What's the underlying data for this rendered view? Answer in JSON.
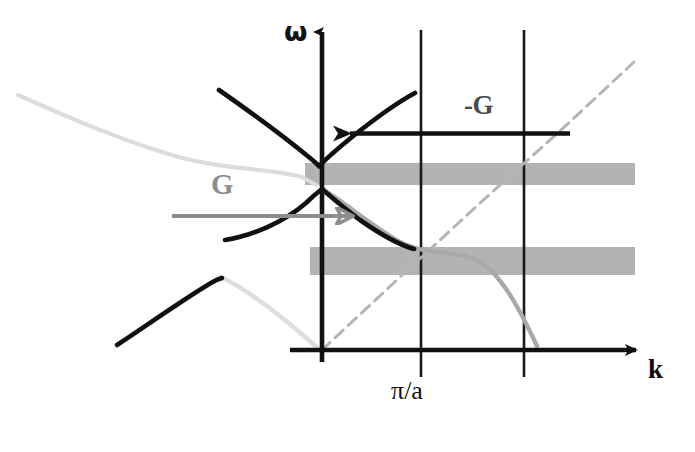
{
  "figure": {
    "background_color": "#ffffff"
  },
  "axes": {
    "y_axis": {
      "label": "ω",
      "name": "omega",
      "x_px": 322,
      "top_px": 25,
      "bottom_px": 360
    },
    "x_axis": {
      "label": "k",
      "name": "wavevector",
      "y_px": 350,
      "left_px": 290,
      "right_px": 645
    },
    "origin": {
      "x_px": 322,
      "y_px": 350
    }
  },
  "ticks": [
    {
      "label": "π/a",
      "x_px": 421,
      "kind": "brillouin-zone-edge"
    },
    {
      "label": "",
      "x_px": 524,
      "kind": "zone-line"
    }
  ],
  "annotations": {
    "neg_g": {
      "label": "-G",
      "color": "#4a4a4a",
      "arrow_direction": "left",
      "arrow_y_px": 133,
      "arrow_from_x_px": 570,
      "arrow_to_x_px": 338
    },
    "g": {
      "label": "G",
      "color": "#8d8d8d",
      "arrow_direction": "right",
      "arrow_y_px": 216,
      "arrow_from_x_px": 172,
      "arrow_to_x_px": 366
    }
  },
  "bands": [
    {
      "name": "upper-gap-band",
      "color": "#b3b3b3",
      "x_px": 305,
      "y_px": 163,
      "width_px": 330,
      "height_px": 22
    },
    {
      "name": "lower-gap-band",
      "color": "#b3b3b3",
      "x_px": 310,
      "y_px": 247,
      "width_px": 325,
      "height_px": 28
    }
  ],
  "chart_data": {
    "type": "line",
    "xlabel": "k",
    "ylabel": "ω",
    "xlim": [
      0,
      695
    ],
    "ylim": [
      452,
      0
    ],
    "grid": false,
    "legend": null,
    "tick_labels_x": [
      "π/a"
    ],
    "series": [
      {
        "name": "upper-band-dark",
        "color": "#111111",
        "width": 4,
        "dash": "solid",
        "points": [
          [
            219,
            90
          ],
          [
            244,
            106
          ],
          [
            268,
            123
          ],
          [
            290,
            139
          ],
          [
            308,
            155
          ],
          [
            319,
            165
          ],
          [
            330,
            156
          ],
          [
            345,
            143
          ],
          [
            362,
            130
          ],
          [
            380,
            117
          ],
          [
            398,
            105
          ],
          [
            415,
            95
          ]
        ]
      },
      {
        "name": "upper-band-light-left",
        "color": "#d8d8d8",
        "width": 4,
        "dash": "solid",
        "points": [
          [
            18,
            95
          ],
          [
            48,
            108
          ],
          [
            80,
            122
          ],
          [
            112,
            136
          ],
          [
            142,
            148
          ],
          [
            170,
            157
          ],
          [
            198,
            163
          ],
          [
            226,
            166
          ],
          [
            252,
            168
          ],
          [
            278,
            172
          ],
          [
            300,
            178
          ],
          [
            315,
            184
          ]
        ]
      },
      {
        "name": "lower-band-dark",
        "color": "#111111",
        "width": 4,
        "dash": "solid",
        "points": [
          [
            225,
            240
          ],
          [
            248,
            234
          ],
          [
            270,
            226
          ],
          [
            292,
            214
          ],
          [
            310,
            199
          ],
          [
            322,
            190
          ],
          [
            336,
            196
          ],
          [
            352,
            208
          ],
          [
            368,
            222
          ],
          [
            384,
            235
          ],
          [
            400,
            244
          ],
          [
            414,
            249
          ]
        ]
      },
      {
        "name": "lower-band-light-right",
        "color": "#a8a8a8",
        "width": 4,
        "dash": "solid",
        "points": [
          [
            322,
            190
          ],
          [
            340,
            198
          ],
          [
            358,
            210
          ],
          [
            376,
            223
          ],
          [
            394,
            236
          ],
          [
            412,
            245
          ],
          [
            430,
            250
          ],
          [
            452,
            252
          ],
          [
            474,
            258
          ],
          [
            496,
            275
          ],
          [
            514,
            300
          ],
          [
            528,
            326
          ],
          [
            538,
            345
          ]
        ]
      },
      {
        "name": "lowest-band-dark-left",
        "color": "#111111",
        "width": 4,
        "dash": "solid",
        "points": [
          [
            117,
            345
          ],
          [
            140,
            330
          ],
          [
            163,
            314
          ],
          [
            186,
            298
          ],
          [
            206,
            285
          ],
          [
            222,
            278
          ]
        ]
      },
      {
        "name": "lowest-band-light-to-origin",
        "color": "#dcdcdc",
        "width": 4,
        "dash": "solid",
        "points": [
          [
            222,
            278
          ],
          [
            244,
            288
          ],
          [
            264,
            301
          ],
          [
            284,
            318
          ],
          [
            302,
            334
          ],
          [
            318,
            348
          ]
        ]
      },
      {
        "name": "light-cone-dashed",
        "color": "#b5b5b5",
        "width": 3,
        "dash": "dashed",
        "points": [
          [
            322,
            350
          ],
          [
            400,
            277
          ],
          [
            480,
            203
          ],
          [
            560,
            131
          ],
          [
            634,
            62
          ]
        ]
      }
    ]
  }
}
